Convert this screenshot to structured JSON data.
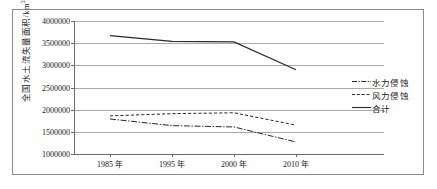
{
  "chart_data": {
    "type": "line",
    "title": "",
    "xlabel": "",
    "ylabel": "全国水土流失量面积/km2",
    "ylabel_text": "全国水土流失量面积/km",
    "ylabel_exponent": "2",
    "categories": [
      "1985 年",
      "1995 年",
      "2000 年",
      "2010 年"
    ],
    "x_values": [
      1985,
      1995,
      2000,
      2010
    ],
    "ylim": [
      1000000,
      4000000
    ],
    "ytick_labels": [
      "1000000",
      "1500000",
      "2000000",
      "2500000",
      "3000000",
      "3500000",
      "4000000"
    ],
    "ytick_values": [
      1000000,
      1500000,
      2000000,
      2500000,
      3000000,
      3500000,
      4000000
    ],
    "grid": true,
    "grid_axis": "y",
    "legend_position": "right",
    "series": [
      {
        "name": "水力侵蚀",
        "style": "dashdot",
        "color": "#2a2a2a",
        "values": [
          1790000,
          1640000,
          1610000,
          1270000
        ]
      },
      {
        "name": "风力侵蚀",
        "style": "dashed",
        "color": "#2a2a2a",
        "values": [
          1860000,
          1910000,
          1930000,
          1650000
        ]
      },
      {
        "name": "合计",
        "style": "solid",
        "color": "#2a2a2a",
        "values": [
          3670000,
          3540000,
          3530000,
          2900000
        ]
      }
    ]
  },
  "legend": {
    "items": [
      {
        "label": "水力侵蚀",
        "style": "dashdot"
      },
      {
        "label": "风力侵蚀",
        "style": "dashed"
      },
      {
        "label": "合计",
        "style": "solid"
      }
    ]
  },
  "axes": {
    "y_ticks": [
      "4000000",
      "3500000",
      "3000000",
      "2500000",
      "2000000",
      "1500000",
      "1000000"
    ],
    "x_ticks": [
      "1985 年",
      "1995 年",
      "2000 年",
      "2010 年"
    ]
  }
}
